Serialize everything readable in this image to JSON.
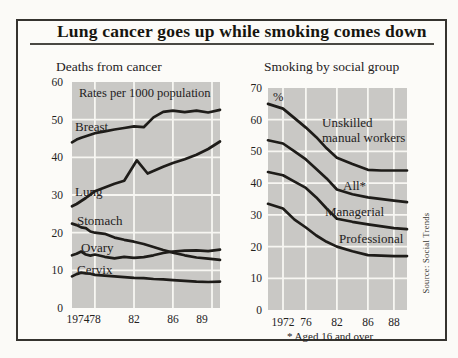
{
  "page": {
    "title": "Lung cancer goes up while smoking comes down",
    "source": "Source: Social Trends"
  },
  "colors": {
    "paper": "#fcfbf8",
    "plot_bg": "#c9c8c5",
    "grid": "#f7f6f2",
    "line": "#1e1c19",
    "text": "#24221d",
    "border": "#35332f"
  },
  "chart_data": [
    {
      "type": "line",
      "title": "Deaths from cancer",
      "unit_label": "Rates per 1000 population",
      "ylim": [
        0,
        60
      ],
      "y_ticks": [
        0,
        10,
        20,
        30,
        40,
        50,
        60
      ],
      "x_tick_labels": [
        "1974",
        "78",
        "82",
        "86",
        "89"
      ],
      "x_ticks": [
        {
          "label": "1974",
          "frac": 0.04
        },
        {
          "label": "78",
          "frac": 0.155
        },
        {
          "label": "82",
          "frac": 0.419
        },
        {
          "label": "86",
          "frac": 0.682
        },
        {
          "label": "89",
          "frac": 0.878
        }
      ],
      "grid_fracs": [
        0.155,
        0.419,
        0.682,
        0.946
      ],
      "x_map": [
        [
          1973,
          0
        ],
        [
          1978,
          0.155
        ],
        [
          1982,
          0.419
        ],
        [
          1986,
          0.682
        ],
        [
          1990,
          1
        ]
      ],
      "series": [
        {
          "name": "Breast",
          "label_lines": [
            "Breast"
          ],
          "points": [
            [
              1973,
              44
            ],
            [
              1974,
              44.7
            ],
            [
              1975,
              45.2
            ],
            [
              1976,
              45.6
            ],
            [
              1977,
              46
            ],
            [
              1978,
              46.4
            ],
            [
              1979,
              46.9
            ],
            [
              1980,
              47.4
            ],
            [
              1981,
              47.8
            ],
            [
              1982,
              48.2
            ],
            [
              1983,
              48
            ],
            [
              1984,
              50.6
            ],
            [
              1985,
              52.1
            ],
            [
              1986,
              52.4
            ],
            [
              1987,
              52
            ],
            [
              1988,
              52.4
            ],
            [
              1989,
              51.9
            ],
            [
              1990,
              52.6
            ]
          ]
        },
        {
          "name": "Lung",
          "label_lines": [
            "Lung"
          ],
          "points": [
            [
              1973,
              27
            ],
            [
              1974,
              27.6
            ],
            [
              1975,
              28.4
            ],
            [
              1976,
              29.2
            ],
            [
              1977,
              30.1
            ],
            [
              1978,
              31
            ],
            [
              1979,
              32
            ],
            [
              1980,
              33
            ],
            [
              1981,
              33.8
            ],
            [
              1982.3,
              39.2
            ],
            [
              1983.4,
              35.7
            ],
            [
              1985,
              37.5
            ],
            [
              1986,
              38.5
            ],
            [
              1987,
              39.5
            ],
            [
              1988,
              40.7
            ],
            [
              1989,
              42.2
            ],
            [
              1990,
              44.2
            ]
          ]
        },
        {
          "name": "Stomach",
          "label_lines": [
            "Stomach"
          ],
          "points": [
            [
              1973,
              22.4
            ],
            [
              1974,
              22
            ],
            [
              1975,
              21.4
            ],
            [
              1976,
              21.2
            ],
            [
              1977,
              20.3
            ],
            [
              1978,
              20
            ],
            [
              1979,
              19.7
            ],
            [
              1980,
              18.7
            ],
            [
              1981,
              18.1
            ],
            [
              1982,
              17.6
            ],
            [
              1983,
              17
            ],
            [
              1984,
              16.2
            ],
            [
              1985,
              15.4
            ],
            [
              1986,
              14.7
            ],
            [
              1987,
              14
            ],
            [
              1988,
              13.4
            ],
            [
              1989,
              13.1
            ],
            [
              1990,
              12.8
            ]
          ]
        },
        {
          "name": "Ovary",
          "label_lines": [
            "Ovary"
          ],
          "points": [
            [
              1973,
              14
            ],
            [
              1974,
              14.4
            ],
            [
              1975,
              15
            ],
            [
              1976,
              14.2
            ],
            [
              1977,
              13.9
            ],
            [
              1978,
              14.2
            ],
            [
              1979,
              13.6
            ],
            [
              1980,
              13.2
            ],
            [
              1981,
              13.6
            ],
            [
              1982,
              13.3
            ],
            [
              1983,
              13.5
            ],
            [
              1984,
              14
            ],
            [
              1985,
              14.6
            ],
            [
              1986,
              15
            ],
            [
              1987,
              15.2
            ],
            [
              1988,
              15.3
            ],
            [
              1989,
              15.1
            ],
            [
              1990,
              15.5
            ]
          ]
        },
        {
          "name": "Cervix",
          "label_lines": [
            "Cervix"
          ],
          "points": [
            [
              1973,
              8.4
            ],
            [
              1974,
              9
            ],
            [
              1975,
              9.4
            ],
            [
              1976,
              9.2
            ],
            [
              1977,
              9.1
            ],
            [
              1978,
              8.8
            ],
            [
              1979,
              8.6
            ],
            [
              1980,
              8.4
            ],
            [
              1981,
              8.2
            ],
            [
              1982,
              8
            ],
            [
              1983,
              7.9
            ],
            [
              1984,
              7.7
            ],
            [
              1985,
              7.6
            ],
            [
              1986,
              7.4
            ],
            [
              1987,
              7.2
            ],
            [
              1988,
              7
            ],
            [
              1989,
              6.9
            ],
            [
              1990,
              7
            ]
          ]
        }
      ]
    },
    {
      "type": "line",
      "title": "Smoking by social group",
      "unit_label": "%",
      "footnote": "* Aged 16 and over",
      "ylim": [
        0,
        70
      ],
      "y_ticks": [
        0,
        10,
        20,
        30,
        40,
        50,
        60,
        70
      ],
      "x_tick_labels": [
        "1972",
        "76",
        "82",
        "86",
        "88"
      ],
      "x_ticks": [
        {
          "label": "1972",
          "frac": 0.108
        },
        {
          "label": "76",
          "frac": 0.273
        },
        {
          "label": "82",
          "frac": 0.496
        },
        {
          "label": "86",
          "frac": 0.719
        },
        {
          "label": "88",
          "frac": 0.906
        }
      ],
      "grid_fracs": [
        0.108,
        0.273,
        0.496,
        0.719,
        0.906
      ],
      "x_map": [
        [
          1971,
          0
        ],
        [
          1972,
          0.108
        ],
        [
          1976,
          0.273
        ],
        [
          1982,
          0.496
        ],
        [
          1986,
          0.719
        ],
        [
          1989,
          1
        ]
      ],
      "series": [
        {
          "name": "Unskilled manual workers",
          "label_lines": [
            "Unskilled",
            "manual workers"
          ],
          "points": [
            [
              1971,
              65
            ],
            [
              1972,
              63.5
            ],
            [
              1974,
              60.5
            ],
            [
              1976,
              57.5
            ],
            [
              1978,
              54.5
            ],
            [
              1980,
              51
            ],
            [
              1982,
              48
            ],
            [
              1984,
              46
            ],
            [
              1986,
              44.2
            ],
            [
              1987,
              44
            ],
            [
              1988,
              44
            ],
            [
              1989,
              44
            ]
          ]
        },
        {
          "name": "All*",
          "label_lines": [
            "All*"
          ],
          "points": [
            [
              1971,
              53.5
            ],
            [
              1972,
              52.5
            ],
            [
              1974,
              50
            ],
            [
              1976,
              47.5
            ],
            [
              1978,
              44.5
            ],
            [
              1980,
              41.5
            ],
            [
              1982,
              38
            ],
            [
              1984,
              36.5
            ],
            [
              1986,
              35.5
            ],
            [
              1988,
              34.5
            ],
            [
              1989,
              34
            ]
          ]
        },
        {
          "name": "Managerial",
          "label_lines": [
            "Managerial"
          ],
          "points": [
            [
              1971,
              43.5
            ],
            [
              1972,
              42.5
            ],
            [
              1974,
              40.5
            ],
            [
              1976,
              38.5
            ],
            [
              1978,
              35.5
            ],
            [
              1980,
              32
            ],
            [
              1982,
              28.8
            ],
            [
              1984,
              27.8
            ],
            [
              1986,
              27
            ],
            [
              1988,
              25.8
            ],
            [
              1989,
              25.5
            ]
          ]
        },
        {
          "name": "Professional",
          "label_lines": [
            "Professional"
          ],
          "points": [
            [
              1971,
              33.5
            ],
            [
              1972,
              32
            ],
            [
              1974,
              28.5
            ],
            [
              1976,
              26
            ],
            [
              1978,
              23.5
            ],
            [
              1980,
              21.5
            ],
            [
              1982,
              20
            ],
            [
              1984,
              18.5
            ],
            [
              1986,
              17.3
            ],
            [
              1988,
              17
            ],
            [
              1989,
              17
            ]
          ]
        }
      ]
    }
  ]
}
